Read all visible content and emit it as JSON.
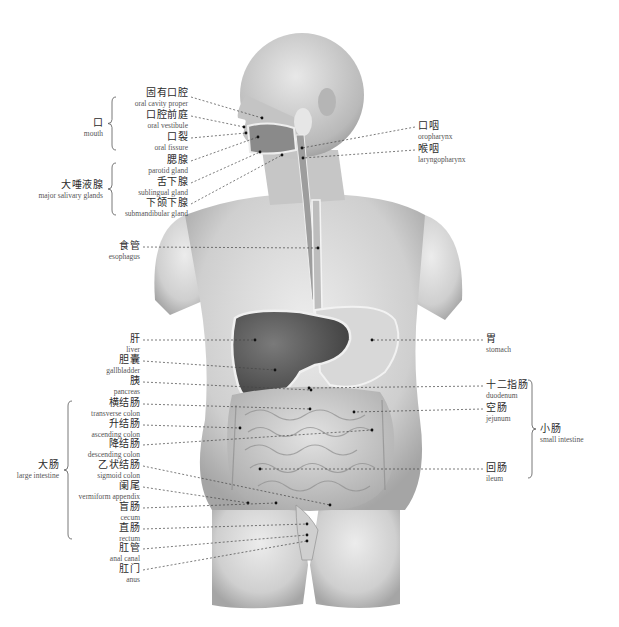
{
  "figure": {
    "left_labels": [
      {
        "zh": "固有口腔",
        "en": "oral cavity proper",
        "x": 188,
        "y": 93,
        "tx": 262,
        "ty": 118
      },
      {
        "zh": "口腔前庭",
        "en": "oral vestibule",
        "x": 188,
        "y": 112,
        "tx": 244,
        "ty": 127
      },
      {
        "zh": "口裂",
        "en": "oral fissure",
        "x": 188,
        "y": 134,
        "tx": 246,
        "ty": 133
      },
      {
        "zh": "腮腺",
        "en": "parotid gland",
        "x": 188,
        "y": 157,
        "tx": 258,
        "ty": 137
      },
      {
        "zh": "舌下腺",
        "en": "sublingual gland",
        "x": 188,
        "y": 179,
        "tx": 260,
        "ty": 152
      },
      {
        "zh": "下颌下腺",
        "en": "submandibular gland",
        "x": 188,
        "y": 200,
        "tx": 282,
        "ty": 155
      },
      {
        "zh": "食管",
        "en": "esophagus",
        "x": 140,
        "y": 243,
        "tx": 318,
        "ty": 248
      },
      {
        "zh": "肝",
        "en": "liver",
        "x": 140,
        "y": 336,
        "tx": 255,
        "ty": 340
      },
      {
        "zh": "胆囊",
        "en": "gallbladder",
        "x": 140,
        "y": 357,
        "tx": 275,
        "ty": 370
      },
      {
        "zh": "胰",
        "en": "pancreas",
        "x": 140,
        "y": 378,
        "tx": 311,
        "ty": 390
      },
      {
        "zh": "横结肠",
        "en": "transverse colon",
        "x": 140,
        "y": 400,
        "tx": 310,
        "ty": 409
      },
      {
        "zh": "升结肠",
        "en": "ascending colon",
        "x": 140,
        "y": 421,
        "tx": 240,
        "ty": 428
      },
      {
        "zh": "降结肠",
        "en": "descending colon",
        "x": 140,
        "y": 441,
        "tx": 372,
        "ty": 430
      },
      {
        "zh": "乙状结肠",
        "en": "sigmoid colon",
        "x": 140,
        "y": 462,
        "tx": 330,
        "ty": 505
      },
      {
        "zh": "阑尾",
        "en": "vermiform appendix",
        "x": 140,
        "y": 483,
        "tx": 248,
        "ty": 503
      },
      {
        "zh": "盲肠",
        "en": "cecum",
        "x": 140,
        "y": 504,
        "tx": 276,
        "ty": 503
      },
      {
        "zh": "直肠",
        "en": "rectum",
        "x": 140,
        "y": 525,
        "tx": 307,
        "ty": 524
      },
      {
        "zh": "肛管",
        "en": "anal canal",
        "x": 140,
        "y": 545,
        "tx": 307,
        "ty": 535
      },
      {
        "zh": "肛门",
        "en": "anus",
        "x": 140,
        "y": 566,
        "tx": 307,
        "ty": 541
      }
    ],
    "right_labels": [
      {
        "zh": "口咽",
        "en": "oropharynx",
        "x": 418,
        "y": 123,
        "tx": 302,
        "ty": 148
      },
      {
        "zh": "喉咽",
        "en": "laryngopharynx",
        "x": 418,
        "y": 146,
        "tx": 303,
        "ty": 158
      },
      {
        "zh": "胃",
        "en": "stomach",
        "x": 486,
        "y": 336,
        "tx": 372,
        "ty": 340
      },
      {
        "zh": "十二指肠",
        "en": "duodenum",
        "x": 486,
        "y": 382,
        "tx": 309,
        "ty": 388
      },
      {
        "zh": "空肠",
        "en": "jejunum",
        "x": 486,
        "y": 405,
        "tx": 354,
        "ty": 412
      },
      {
        "zh": "回肠",
        "en": "ileum",
        "x": 486,
        "y": 465,
        "tx": 260,
        "ty": 469
      }
    ],
    "groups": [
      {
        "zh": "口",
        "en": "mouth",
        "side": "left",
        "x": 104,
        "y": 124,
        "brace_top": 97,
        "brace_bottom": 150
      },
      {
        "zh": "大唾液腺",
        "en": "major salivary glands",
        "side": "left",
        "x": 104,
        "y": 186,
        "brace_top": 163,
        "brace_bottom": 215
      },
      {
        "zh": "大肠",
        "en": "large intestine",
        "side": "left",
        "x": 60,
        "y": 465,
        "brace_top": 401,
        "brace_bottom": 539
      },
      {
        "zh": "小肠",
        "en": "small intestine",
        "side": "right",
        "x": 540,
        "y": 424,
        "brace_top": 380,
        "brace_bottom": 478
      }
    ],
    "colors": {
      "background": "#ffffff",
      "skin_light": "#e4e4e4",
      "skin_dark": "#9a9a9a",
      "organ_dark": "#5a5a5a",
      "organ_mid": "#8a8a8a",
      "intestine": "#c9c9c9",
      "leader_line": "#444444"
    }
  }
}
